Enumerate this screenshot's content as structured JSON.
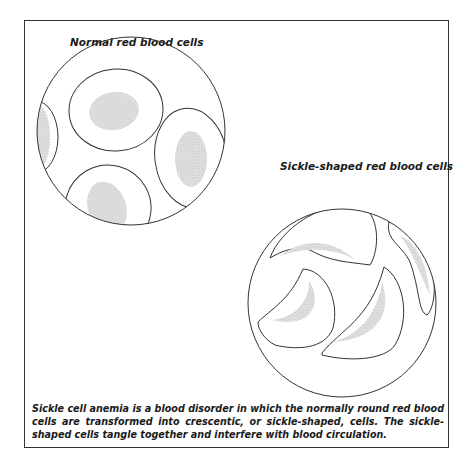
{
  "figure": {
    "panels": [
      {
        "id": "normal",
        "title": "Normal red blood cells"
      },
      {
        "id": "sickle",
        "title": "Sickle-shaped red blood cells"
      }
    ],
    "caption": "Sickle cell anemia is a blood disorder in which the normally round red blood cells are transformed into crescentic, or sickle-shaped, cells. The sickle-shaped cells tangle together and interfere with blood circulation.",
    "colors": {
      "outline": "#333333",
      "stipple": "#c8c8c8",
      "background": "#ffffff"
    }
  }
}
